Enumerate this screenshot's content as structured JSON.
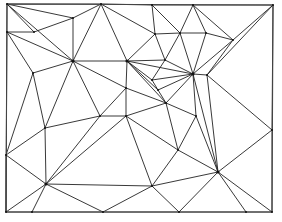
{
  "diagram": {
    "type": "triangulation",
    "width": 282,
    "height": 222,
    "colors": {
      "background": "#ffffff",
      "edge": "#222222",
      "border": "#444444",
      "vertex": "#111111"
    },
    "border": [
      [
        7,
        4
      ],
      [
        273,
        5
      ],
      [
        272,
        212
      ],
      [
        6,
        212
      ]
    ],
    "vertices": {
      "tl": [
        7,
        4
      ],
      "t1": [
        101,
        4
      ],
      "t2": [
        152,
        5
      ],
      "t3": [
        193,
        5
      ],
      "tr": [
        273,
        5
      ],
      "l1": [
        7,
        32
      ],
      "l2": [
        6,
        155
      ],
      "bl": [
        6,
        212
      ],
      "b1": [
        32,
        212
      ],
      "b2": [
        103,
        212
      ],
      "b3": [
        179,
        212
      ],
      "b4": [
        246,
        212
      ],
      "br": [
        272,
        212
      ],
      "r1": [
        272,
        130
      ],
      "A": [
        34,
        32
      ],
      "B": [
        73,
        18
      ],
      "C": [
        73,
        61
      ],
      "D": [
        127,
        61
      ],
      "E": [
        33,
        73
      ],
      "F": [
        180,
        33
      ],
      "G": [
        206,
        33
      ],
      "H": [
        193,
        74
      ],
      "I": [
        207,
        75
      ],
      "J": [
        233,
        40
      ],
      "K": [
        165,
        60
      ],
      "L": [
        155,
        34
      ],
      "M": [
        126,
        88
      ],
      "N": [
        100,
        116
      ],
      "O": [
        45,
        128
      ],
      "P": [
        46,
        184
      ],
      "Q": [
        126,
        116
      ],
      "R": [
        166,
        103
      ],
      "S": [
        178,
        150
      ],
      "T": [
        152,
        80
      ],
      "U": [
        158,
        90
      ],
      "V": [
        196,
        116
      ],
      "W": [
        218,
        172
      ],
      "X": [
        152,
        186
      ]
    },
    "edges": [
      [
        "tl",
        "t1"
      ],
      [
        "t1",
        "t2"
      ],
      [
        "t2",
        "t3"
      ],
      [
        "t3",
        "tr"
      ],
      [
        "tr",
        "r1"
      ],
      [
        "r1",
        "br"
      ],
      [
        "br",
        "bl"
      ],
      [
        "bl",
        "tl"
      ],
      [
        "tl",
        "A"
      ],
      [
        "tl",
        "C"
      ],
      [
        "A",
        "l1"
      ],
      [
        "l1",
        "C"
      ],
      [
        "A",
        "B"
      ],
      [
        "tl",
        "B"
      ],
      [
        "B",
        "t1"
      ],
      [
        "B",
        "C"
      ],
      [
        "t1",
        "C"
      ],
      [
        "t1",
        "D"
      ],
      [
        "t1",
        "L"
      ],
      [
        "l1",
        "E"
      ],
      [
        "E",
        "C"
      ],
      [
        "E",
        "O"
      ],
      [
        "E",
        "l2"
      ],
      [
        "C",
        "D"
      ],
      [
        "C",
        "M"
      ],
      [
        "C",
        "N"
      ],
      [
        "C",
        "O"
      ],
      [
        "t2",
        "L"
      ],
      [
        "t2",
        "F"
      ],
      [
        "L",
        "F"
      ],
      [
        "L",
        "K"
      ],
      [
        "F",
        "K"
      ],
      [
        "L",
        "D"
      ],
      [
        "t3",
        "F"
      ],
      [
        "t3",
        "G"
      ],
      [
        "F",
        "G"
      ],
      [
        "G",
        "J"
      ],
      [
        "t3",
        "J"
      ],
      [
        "tr",
        "J"
      ],
      [
        "J",
        "H"
      ],
      [
        "J",
        "I"
      ],
      [
        "tr",
        "I"
      ],
      [
        "G",
        "H"
      ],
      [
        "K",
        "H"
      ],
      [
        "F",
        "H"
      ],
      [
        "D",
        "K"
      ],
      [
        "D",
        "H"
      ],
      [
        "D",
        "T"
      ],
      [
        "D",
        "U"
      ],
      [
        "D",
        "M"
      ],
      [
        "D",
        "R"
      ],
      [
        "T",
        "H"
      ],
      [
        "T",
        "U"
      ],
      [
        "T",
        "K"
      ],
      [
        "U",
        "H"
      ],
      [
        "U",
        "R"
      ],
      [
        "R",
        "H"
      ],
      [
        "H",
        "I"
      ],
      [
        "I",
        "r1"
      ],
      [
        "I",
        "W"
      ],
      [
        "H",
        "V"
      ],
      [
        "H",
        "W"
      ],
      [
        "M",
        "N"
      ],
      [
        "M",
        "Q"
      ],
      [
        "M",
        "R"
      ],
      [
        "N",
        "Q"
      ],
      [
        "N",
        "O"
      ],
      [
        "N",
        "P"
      ],
      [
        "Q",
        "R"
      ],
      [
        "Q",
        "S"
      ],
      [
        "Q",
        "X"
      ],
      [
        "R",
        "V"
      ],
      [
        "R",
        "S"
      ],
      [
        "V",
        "S"
      ],
      [
        "V",
        "W"
      ],
      [
        "S",
        "W"
      ],
      [
        "O",
        "P"
      ],
      [
        "O",
        "l2"
      ],
      [
        "l2",
        "P"
      ],
      [
        "l2",
        "bl"
      ],
      [
        "bl",
        "P"
      ],
      [
        "P",
        "b1"
      ],
      [
        "P",
        "b2"
      ],
      [
        "P",
        "Q"
      ],
      [
        "P",
        "X"
      ],
      [
        "b2",
        "X"
      ],
      [
        "X",
        "b3"
      ],
      [
        "X",
        "W"
      ],
      [
        "X",
        "S"
      ],
      [
        "W",
        "b3"
      ],
      [
        "W",
        "b4"
      ],
      [
        "W",
        "br"
      ],
      [
        "W",
        "r1"
      ]
    ],
    "hub_vertices": [
      "C",
      "D",
      "H",
      "W",
      "P"
    ]
  }
}
